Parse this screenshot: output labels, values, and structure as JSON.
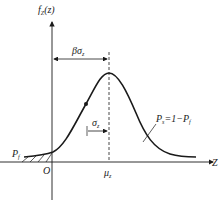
{
  "diagram": {
    "type": "probability-density-curve",
    "y_axis_label": {
      "main": "f",
      "sub": "Z",
      "arg": "(z)"
    },
    "x_axis_label": "Z",
    "origin_label": "O",
    "mean_label": {
      "main": "μ",
      "sub": "z"
    },
    "reliability_index_label": {
      "main": "βσ",
      "sub": "z"
    },
    "std_dev_label": {
      "main": "σ",
      "sub": "z"
    },
    "failure_prob_label": {
      "main": "P",
      "sub": "f"
    },
    "reliability_label": {
      "main": "P",
      "sub": "s",
      "rest": "=1−P",
      "rest_sub": "f"
    },
    "colors": {
      "stroke": "#1a1a1a",
      "text": "#222222",
      "background": "#ffffff"
    }
  }
}
